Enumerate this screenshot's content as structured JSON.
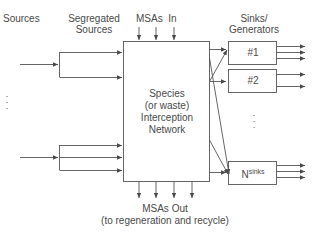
{
  "labels": {
    "sources": "Sources",
    "segregated_line1": "Segregated",
    "segregated_line2": "Sources",
    "msas_in": "MSAs  In",
    "sinks_line1": "Sinks/",
    "sinks_line2": "Generators",
    "network_line1": "Species",
    "network_line2": "(or waste)",
    "network_line3": "Interception",
    "network_line4": "Network",
    "msas_out": "MSAs Out",
    "msas_out_note": "(to regeneration and recycle)"
  },
  "sinks": [
    {
      "label": "#1"
    },
    {
      "label": "#2"
    },
    {
      "label_base": "N",
      "label_sup": "sinks"
    }
  ],
  "ellipsis": "⋮",
  "colors": {
    "line": "#4a4a4a",
    "text": "#4a4a4a",
    "background": "#ffffff"
  }
}
